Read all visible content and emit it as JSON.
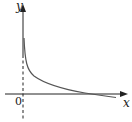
{
  "diagram": {
    "type": "function-graph",
    "axes": {
      "x_label": "x",
      "y_label": "y",
      "origin_label": "0"
    },
    "curve": {
      "color": "#555555",
      "shape": "decreasing, concave up, approaching y-axis asymptotically, crossing x-axis"
    },
    "asymptote": {
      "style": "dashed",
      "position": "y-axis"
    }
  }
}
